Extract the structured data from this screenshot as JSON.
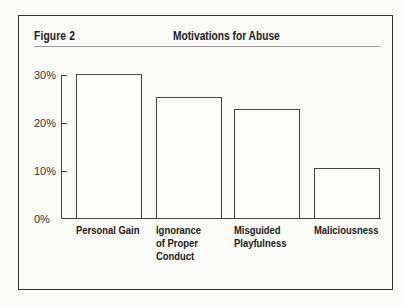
{
  "figure": {
    "label": "Figure 2",
    "title": "Motivations for Abuse"
  },
  "y_ticks": [
    "30%",
    "20%",
    "10%",
    "0%"
  ],
  "bars": [
    {
      "label": "Personal Gain",
      "value": 30
    },
    {
      "label": "Ignorance\nof Proper\nConduct",
      "value": 25.2
    },
    {
      "label": "Misguided\nPlayfulness",
      "value": 22.7
    },
    {
      "label": "Maliciousness",
      "value": 10.4
    }
  ],
  "chart_data": {
    "type": "bar",
    "title": "Motivations for Abuse",
    "figure_label": "Figure 2",
    "categories": [
      "Personal Gain",
      "Ignorance of Proper Conduct",
      "Misguided Playfulness",
      "Maliciousness"
    ],
    "values": [
      30,
      25,
      23,
      10
    ],
    "xlabel": "",
    "ylabel": "",
    "yticks": [
      "0%",
      "10%",
      "20%",
      "30%"
    ],
    "ylim": [
      0,
      30
    ],
    "grid": false,
    "legend": null
  }
}
